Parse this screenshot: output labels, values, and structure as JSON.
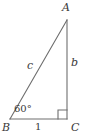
{
  "diagram": {
    "type": "right-triangle",
    "stroke_color": "#6e6e6e",
    "text_color": "#3a3a3a",
    "background_color": "#ffffff",
    "vertices": {
      "A": {
        "label": "A",
        "x": 67,
        "y": 20
      },
      "B": {
        "label": "B",
        "x": 10,
        "y": 119
      },
      "C": {
        "label": "C",
        "x": 67,
        "y": 119
      }
    },
    "sides": {
      "vertical": {
        "label": "b",
        "from": "C",
        "to": "A"
      },
      "hypotenuse": {
        "label": "c",
        "from": "B",
        "to": "A"
      },
      "base": {
        "label": "1",
        "from": "B",
        "to": "C"
      }
    },
    "angles": {
      "at_B": {
        "label": "60°"
      },
      "at_C": {
        "label": "right-angle-mark",
        "marker": "square"
      }
    }
  }
}
